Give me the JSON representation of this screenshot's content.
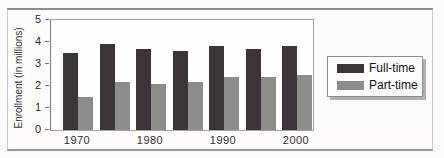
{
  "chart_data": {
    "type": "bar",
    "title": "",
    "categories": [
      "1970",
      "1975",
      "1980",
      "1985",
      "1990",
      "1995",
      "2000"
    ],
    "x_tick_labels": [
      "1970",
      "1980",
      "1990",
      "2000"
    ],
    "x_tick_every": 2,
    "series": [
      {
        "name": "Full-time",
        "color": "#3b3438",
        "values": [
          3.5,
          3.9,
          3.7,
          3.6,
          3.8,
          3.7,
          3.8
        ]
      },
      {
        "name": "Part-time",
        "color": "#8e8b8b",
        "values": [
          1.5,
          2.2,
          2.1,
          2.2,
          2.4,
          2.4,
          2.5
        ]
      }
    ],
    "xlabel": "",
    "ylabel": "Enrollment (in millions)",
    "ylim": [
      0,
      5
    ],
    "yticks": [
      "0",
      "1",
      "2",
      "3",
      "4",
      "5"
    ],
    "grid": false,
    "legend_position": "right"
  }
}
